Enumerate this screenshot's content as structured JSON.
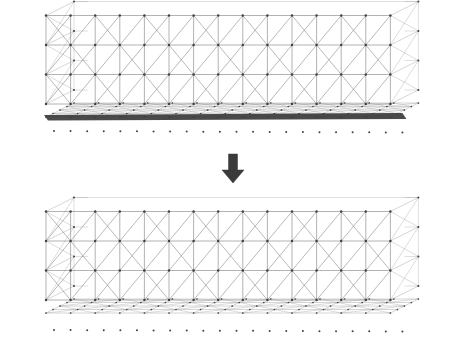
{
  "figure": {
    "type": "diagram",
    "background_color": "#ffffff",
    "width": 464,
    "height": 351,
    "line_color": "#8a8a8a",
    "node_color": "#404040",
    "dark_band_color": "#3b3b3b",
    "arrow_color": "#3a3a3a"
  },
  "panels": [
    {
      "id": "top-panel",
      "name": "initial-structure",
      "caption": "",
      "origin_x": 46,
      "origin_y": 104,
      "bay_count": 14,
      "bay_width": 24.6,
      "story_count": 3,
      "story_height": 29.5,
      "depth_dx": 28,
      "depth_dy": -14,
      "depth_rows": 4,
      "floor_cols": 14,
      "floor_ground_y": 117,
      "has_solid_slab": true,
      "slab_y": 115,
      "slab_thickness": 4,
      "dot_row_y": 131,
      "dot_count": 22,
      "bracing": "alternating-x",
      "floor_style": "dense-diagonal-grid"
    },
    {
      "id": "bottom-panel",
      "name": "optimized-structure",
      "caption": "",
      "origin_x": 46,
      "origin_y": 300,
      "bay_count": 14,
      "bay_width": 24.6,
      "story_count": 3,
      "story_height": 29.5,
      "depth_dx": 28,
      "depth_dy": -14,
      "depth_rows": 4,
      "floor_cols": 14,
      "floor_ground_y": 313,
      "has_solid_slab": false,
      "slab_y": 0,
      "slab_thickness": 0,
      "dot_row_y": 330,
      "dot_count": 22,
      "bracing": "alternating-x",
      "floor_style": "open-lattice"
    }
  ],
  "arrow": {
    "name": "downward-arrow",
    "label": "",
    "x": 233,
    "y_top": 154,
    "y_bottom": 183,
    "shaft_width": 9,
    "head_width": 22,
    "head_height": 13,
    "color": "#3a3a3a"
  }
}
